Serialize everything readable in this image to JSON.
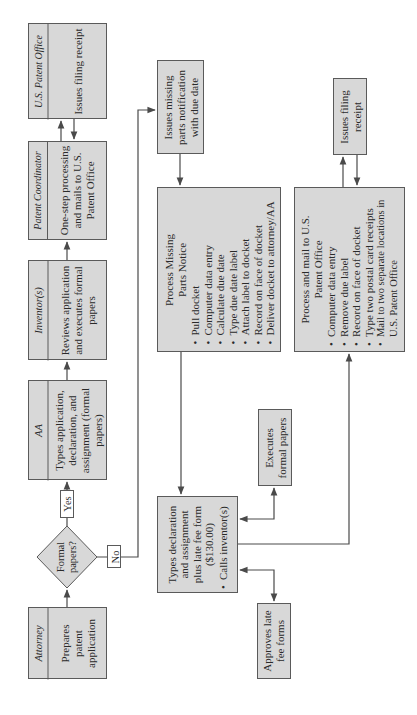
{
  "diagram": {
    "orientation": "rotated 90 degrees counter-clockwise",
    "colors": {
      "box_fill": "#d8d8d8",
      "border": "#5a5a5a",
      "line": "#4a4a4a",
      "background": "#ffffff"
    },
    "swimlanes": [
      {
        "id": "attorney",
        "role": "Attorney",
        "text": "Prepares patent application"
      },
      {
        "id": "aa",
        "role": "AA",
        "text": "Types application, declaration, and assignment (formal papers)"
      },
      {
        "id": "inventor",
        "role": "Inventor(s)",
        "text": "Reviews application and executes formal papers"
      },
      {
        "id": "patent-coordinator",
        "role": "Patent Coordinator",
        "text": "One-step processing and mails to U.S. Patent Office"
      },
      {
        "id": "uspto",
        "role": "U.S. Patent Office",
        "text": "Issues filing receipt"
      }
    ],
    "decision": {
      "text": "Formal papers?",
      "yes_label": "Yes",
      "no_label": "No"
    },
    "boxes": {
      "issues_missing": {
        "text": "Issues missing parts notification with due date"
      },
      "process_missing": {
        "title": "Process Missing Parts Notice",
        "items": [
          "Pull docket",
          "Computer data entry",
          "Calculate due date",
          "Type due date label",
          "Attach label to docket",
          "Record on face of docket",
          "Deliver docket to attorney/AA"
        ]
      },
      "types_declaration": {
        "title": "Types declaration and assignment plus late fee form ($130.00)",
        "items": [
          "Calls inventor(s)"
        ]
      },
      "executes": {
        "text": "Executes formal papers"
      },
      "approves": {
        "text": "Approves late fee forms"
      },
      "process_mail": {
        "title": "Process and mail to U.S. Patent Office",
        "items": [
          "Computer data entry",
          "Remove due label",
          "Record on face of docket",
          "Type two postal card receipts",
          "Mail to two separate locations in U.S. Patent Office"
        ]
      },
      "issues_filing_2": {
        "text": "Issues filing receipt"
      }
    }
  }
}
